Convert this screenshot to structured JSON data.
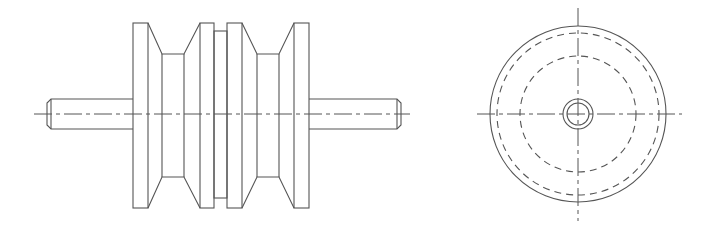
{
  "drawing": {
    "title": "Double-groove V-belt pulley with shaft — orthographic views",
    "line_color": "#555555",
    "background": "#ffffff",
    "views": [
      {
        "name": "front-view",
        "label": "Front view",
        "shaft": {
          "x1": 47,
          "x2": 401,
          "y_top": 99,
          "y_bottom": 129,
          "chamfer": 4
        },
        "centerline_y": 114,
        "centerline_x": [
          34,
          410
        ],
        "flanges": [
          {
            "x1": 133,
            "x2": 148,
            "y_top": 23,
            "y_bottom": 208
          },
          {
            "x1": 200,
            "x2": 214,
            "y_top": 23,
            "y_bottom": 208
          },
          {
            "x1": 227,
            "x2": 242,
            "y_top": 23,
            "y_bottom": 208
          },
          {
            "x1": 294,
            "x2": 309,
            "y_top": 23,
            "y_bottom": 208
          }
        ],
        "grooves": [
          {
            "x1": 148,
            "x2": 200,
            "inner_x1": 162,
            "inner_x2": 184,
            "inner_top": 54,
            "inner_bottom": 177
          },
          {
            "x1": 242,
            "x2": 294,
            "inner_x1": 257,
            "inner_x2": 279,
            "inner_top": 54,
            "inner_bottom": 177
          }
        ],
        "spacer": {
          "x1": 214,
          "x2": 227,
          "y_top": 31,
          "y_bottom": 198
        }
      },
      {
        "name": "side-view",
        "label": "Side view",
        "center": [
          578,
          114
        ],
        "circles": [
          {
            "r": 88,
            "style": "solid"
          },
          {
            "r": 81,
            "style": "hidden"
          },
          {
            "r": 58,
            "style": "hidden"
          },
          {
            "r": 15,
            "style": "solid"
          },
          {
            "r": 11,
            "style": "solid"
          }
        ],
        "centerline_h": [
          477,
          682
        ],
        "centerline_v": [
          8,
          221
        ]
      }
    ]
  }
}
